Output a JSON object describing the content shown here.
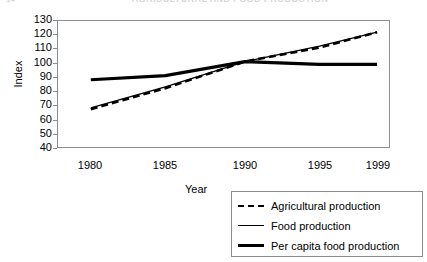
{
  "figure_number": "14",
  "chart_data": {
    "type": "line",
    "title": "AGRICULTURAL AND FOOD PRODUCTION",
    "xlabel": "Year",
    "ylabel": "Index",
    "x": [
      1980,
      1985,
      1990,
      1995,
      1999
    ],
    "xtick_labels": [
      "1980",
      "1985",
      "1990",
      "1995",
      "1999"
    ],
    "ytick_labels": [
      "130",
      "120",
      "110",
      "100",
      "90",
      "80",
      "70",
      "60",
      "50",
      "40"
    ],
    "ylim": [
      40,
      130
    ],
    "ytick_step": 10,
    "grid": false,
    "legend_position": "bottom-right-outside",
    "series": [
      {
        "name": "Agricultural production",
        "style": "dashed",
        "values": [
          67,
          82,
          101,
          111,
          122
        ]
      },
      {
        "name": "Food production",
        "style": "thin-solid",
        "values": [
          68,
          83,
          101,
          112,
          122
        ]
      },
      {
        "name": "Per capita food production",
        "style": "thick-solid",
        "values": [
          88,
          91,
          101,
          99,
          99
        ]
      }
    ]
  },
  "legend": {
    "items": [
      {
        "label": "Agricultural production",
        "style": "dashed"
      },
      {
        "label": "Food production",
        "style": "thin-solid"
      },
      {
        "label": "Per capita food production",
        "style": "thick-solid"
      }
    ]
  }
}
